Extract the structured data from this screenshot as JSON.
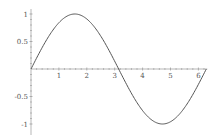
{
  "chart_data": {
    "type": "line",
    "title": "",
    "xlabel": "",
    "ylabel": "",
    "xlim": [
      0,
      6.2832
    ],
    "ylim": [
      -1,
      1
    ],
    "grid": false,
    "legend": null,
    "x_ticks": [
      "1",
      "2",
      "3",
      "4",
      "5",
      "6"
    ],
    "y_ticks": [
      "1",
      "0.5",
      "-0.5",
      "-1"
    ],
    "series": [
      {
        "name": "sin(x)",
        "function": "sin(x)",
        "x": [
          0,
          0.5,
          1,
          1.5708,
          2,
          2.5,
          3,
          3.1416,
          3.5,
          4,
          4.7124,
          5,
          5.5,
          6,
          6.2832
        ],
        "values": [
          0,
          0.479,
          0.841,
          1,
          0.909,
          0.598,
          0.141,
          0,
          -0.351,
          -0.757,
          -1,
          -0.959,
          -0.706,
          -0.279,
          0
        ]
      }
    ],
    "colors": {
      "curve": "#555555",
      "axis": "#888888",
      "text": "#555555"
    }
  }
}
